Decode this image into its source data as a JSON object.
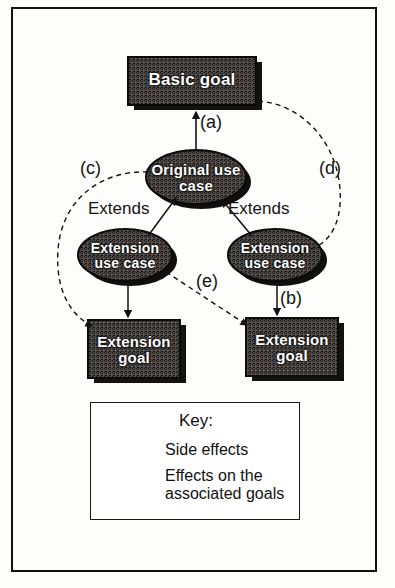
{
  "diagram": {
    "nodes": [
      {
        "id": "basic-goal",
        "label": "Basic goal",
        "shape": "box",
        "x": 128,
        "y": 57,
        "w": 128,
        "h": 48
      },
      {
        "id": "original-use-case",
        "label": "Original use case",
        "shape": "ellipse",
        "cx": 196,
        "cy": 177,
        "rx": 50,
        "ry": 27
      },
      {
        "id": "extension-use-case-left",
        "label": "Extension use case",
        "shape": "ellipse",
        "cx": 125,
        "cy": 255,
        "rx": 47,
        "ry": 26
      },
      {
        "id": "extension-use-case-right",
        "label": "Extension use case",
        "shape": "ellipse",
        "cx": 275,
        "cy": 255,
        "rx": 47,
        "ry": 26
      },
      {
        "id": "extension-goal-left",
        "label": "Extension goal",
        "shape": "box",
        "x": 88,
        "y": 320,
        "w": 92,
        "h": 58
      },
      {
        "id": "extension-goal-right",
        "label": "Extension goal",
        "shape": "box",
        "x": 246,
        "y": 318,
        "w": 92,
        "h": 58
      }
    ],
    "edges": [
      {
        "id": "edge-a",
        "label": "(a)",
        "style": "solid",
        "from": "original-use-case",
        "to": "basic-goal",
        "label_x": 200,
        "label_y": 112
      },
      {
        "id": "edge-b",
        "label": "(b)",
        "style": "solid",
        "from": "extension-use-case-right",
        "to": "extension-goal-right",
        "label_x": 280,
        "label_y": 288
      },
      {
        "id": "edge-c",
        "label": "(c)",
        "style": "dashed",
        "from": "original-use-case",
        "to": "extension-goal-left",
        "label_x": 80,
        "label_y": 158
      },
      {
        "id": "edge-d",
        "label": "(d)",
        "style": "dashed",
        "from": "basic-goal",
        "to": "extension-use-case-right",
        "label_x": 319,
        "label_y": 158
      },
      {
        "id": "edge-e",
        "label": "(e)",
        "style": "dashed",
        "from": "extension-use-case-left",
        "to": "extension-goal-right",
        "label_x": 196,
        "label_y": 271
      },
      {
        "id": "edge-extends-left",
        "label": "Extends",
        "style": "solid",
        "from": "extension-use-case-left",
        "to": "original-use-case",
        "label_x": 88,
        "label_y": 200
      },
      {
        "id": "edge-extends-right",
        "label": "Extends",
        "style": "solid",
        "from": "extension-use-case-right",
        "to": "original-use-case",
        "label_x": 228,
        "label_y": 200
      },
      {
        "id": "edge-left-goal",
        "label": "",
        "style": "solid",
        "from": "extension-use-case-left",
        "to": "extension-goal-left",
        "label_x": 0,
        "label_y": 0
      }
    ]
  },
  "key": {
    "title": "Key:",
    "rows": [
      {
        "id": "key-side-effects",
        "style": "dashed",
        "label": "Side effects"
      },
      {
        "id": "key-associated-goals",
        "style": "solid",
        "label": "Effects on the associated goals"
      }
    ]
  },
  "colors": {
    "node_fill": "#3d3a37",
    "node_text": "#ffffff",
    "line": "#1a1a1a",
    "frame": "#111111",
    "background": "#fdfdfc"
  }
}
